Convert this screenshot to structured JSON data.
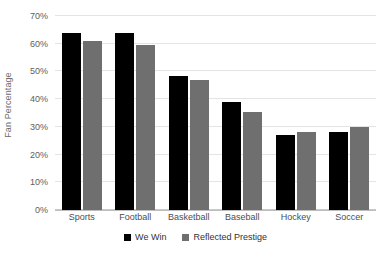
{
  "chart_data": {
    "type": "bar",
    "title": "",
    "subtitle": "",
    "xlabel": "",
    "ylabel": "Fan Percentage",
    "categories": [
      "Sports",
      "Football",
      "Basketball",
      "Baseball",
      "Hockey",
      "Soccer"
    ],
    "series": [
      {
        "name": "We Win",
        "color": "#000000",
        "values": [
          64,
          64,
          48.5,
          39,
          27,
          28
        ]
      },
      {
        "name": "Reflected Prestige",
        "color": "#6f6f6f",
        "values": [
          61,
          59.5,
          47,
          35.5,
          28,
          30
        ]
      }
    ],
    "ylim": [
      0,
      70
    ],
    "ytick_values": [
      0,
      10,
      20,
      30,
      40,
      50,
      60,
      70
    ],
    "ytick_labels": [
      "0%",
      "10%",
      "20%",
      "30%",
      "40%",
      "50%",
      "60%",
      "70%"
    ],
    "grid": true,
    "grid_axis": "y",
    "legend_position": "bottom",
    "background_color": "#ffffff",
    "gridline_color": "#e4e4e4"
  }
}
